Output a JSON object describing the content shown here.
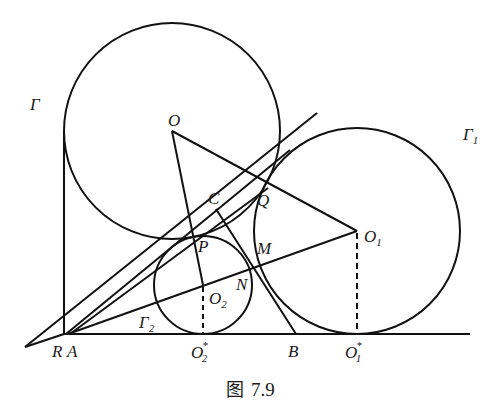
{
  "figure": {
    "caption_prefix": "图",
    "caption_number": "7.9",
    "stroke_color": "#111111",
    "background": "#ffffff"
  },
  "circles": [
    {
      "name": "Γ",
      "label": "Γ",
      "center": "O",
      "cx": 172,
      "cy": 131,
      "r": 108
    },
    {
      "name": "Γ1",
      "label": "Γ",
      "label_sub": "1",
      "center": "O1",
      "cx": 357,
      "cy": 231,
      "r": 103
    },
    {
      "name": "Γ2",
      "label": "Γ",
      "label_sub": "2",
      "center": "O2",
      "cx": 203,
      "cy": 285,
      "r": 49
    }
  ],
  "points": {
    "O": {
      "label": "O",
      "x": 172,
      "y": 131
    },
    "O1": {
      "label": "O",
      "sub": "1",
      "x": 357,
      "y": 231
    },
    "O2": {
      "label": "O",
      "sub": "2",
      "x": 203,
      "y": 285
    },
    "O1star": {
      "label": "O",
      "sub": "1",
      "sup": "*",
      "x": 357,
      "y": 334
    },
    "O2star": {
      "label": "O",
      "sub": "2",
      "sup": "*",
      "x": 203,
      "y": 334
    },
    "R": {
      "label": "R",
      "x": 64,
      "y": 334
    },
    "A": {
      "label": "A",
      "x": 68,
      "y": 334
    },
    "B": {
      "label": "B",
      "x": 296,
      "y": 334
    },
    "C": {
      "label": "C",
      "x": 216,
      "y": 209
    },
    "P": {
      "label": "P",
      "x": 190,
      "y": 232
    },
    "Q": {
      "label": "Q",
      "x": 260,
      "y": 196
    },
    "M": {
      "label": "M",
      "x": 254,
      "y": 262
    },
    "N": {
      "label": "N",
      "x": 253,
      "y": 286
    }
  },
  "labels": {
    "gamma": "Γ",
    "gamma1_main": "Γ",
    "gamma1_sub": "1",
    "gamma2_main": "Γ",
    "gamma2_sub": "2",
    "O": "O",
    "O1_main": "O",
    "O1_sub": "1",
    "O2_main": "O",
    "O2_sub": "2",
    "O1s_main": "O",
    "O1s_sub": "1",
    "O1s_sup": "*",
    "O2s_main": "O",
    "O2s_sub": "2",
    "O2s_sup": "*",
    "R": "R",
    "A": "A",
    "B": "B",
    "C": "C",
    "P": "P",
    "Q": "Q",
    "M": "M",
    "N": "N"
  }
}
